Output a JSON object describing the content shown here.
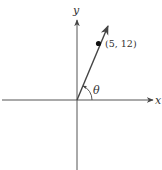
{
  "diagram": {
    "x_axis_label": "x",
    "y_axis_label": "y",
    "angle_label": "θ",
    "point_label": "(5, 12)",
    "point": {
      "x": 5,
      "y": 12
    },
    "colors": {
      "axis": "#555555",
      "ray": "#444444",
      "point": "#111111"
    }
  }
}
